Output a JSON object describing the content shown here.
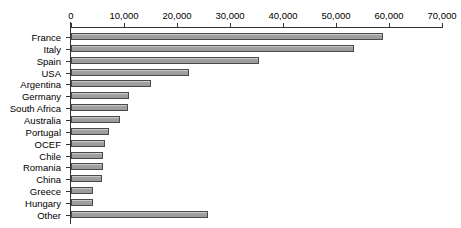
{
  "chart_data": {
    "type": "bar",
    "orientation": "horizontal",
    "title": "",
    "subtitle": "",
    "xlabel": "",
    "ylabel": "",
    "xlim": [
      0,
      70000
    ],
    "grid": false,
    "legend": false,
    "axis_position": "top",
    "tick_labels": [
      "0",
      "10,000",
      "20,000",
      "30,000",
      "40,000",
      "50,000",
      "60,000",
      "70,000"
    ],
    "tick_values": [
      0,
      10000,
      20000,
      30000,
      40000,
      50000,
      60000,
      70000
    ],
    "categories": [
      "France",
      "Italy",
      "Spain",
      "USA",
      "Argentina",
      "Germany",
      "South Africa",
      "Australia",
      "Portugal",
      "OCEF",
      "Chile",
      "Romania",
      "China",
      "Greece",
      "Hungary",
      "Other"
    ],
    "values": [
      58900,
      53400,
      35400,
      22200,
      15000,
      11000,
      10700,
      9200,
      7200,
      6400,
      6100,
      6000,
      5800,
      4200,
      4100,
      25900
    ],
    "colors": {
      "bar_fill": "#9e9e9e",
      "bar_edge": "#4a4a4a",
      "axis": "#333333",
      "text": "#000000",
      "background": "#ffffff"
    }
  }
}
